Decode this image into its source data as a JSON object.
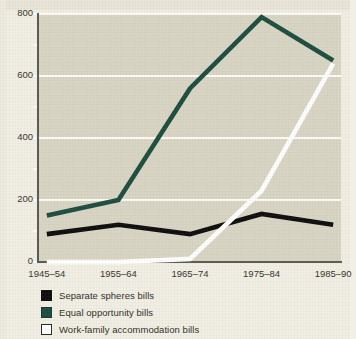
{
  "chart_data": {
    "type": "line",
    "title": "",
    "subtitle": "",
    "xlabel": "",
    "ylabel": "",
    "categories": [
      "1945–54",
      "1955–64",
      "1965–74",
      "1975–84",
      "1985–90"
    ],
    "ylim": [
      0,
      800
    ],
    "ytick_labels": [
      "0",
      "200",
      "400",
      "600",
      "800"
    ],
    "ytick_values": [
      0,
      200,
      400,
      600,
      800
    ],
    "yminor_tick_values": [
      100,
      300,
      500,
      700
    ],
    "grid": "horizontal-major-only",
    "legend_position": "below-plot-left",
    "series": [
      {
        "name": "Separate spheres bills",
        "color": "#0d0d0d",
        "values": [
          90,
          120,
          90,
          155,
          120
        ]
      },
      {
        "name": "Equal opportunity bills",
        "color": "#1d4d3f",
        "values": [
          150,
          200,
          560,
          790,
          650
        ]
      },
      {
        "name": "Work-family accommodation bills",
        "color": "#ffffff",
        "values": [
          0,
          0,
          10,
          230,
          640
        ]
      }
    ]
  },
  "axes": {
    "y_ticks": [
      {
        "label": "800",
        "value": 800,
        "major": true
      },
      {
        "label": "",
        "value": 700,
        "major": false
      },
      {
        "label": "600",
        "value": 600,
        "major": true
      },
      {
        "label": "",
        "value": 500,
        "major": false
      },
      {
        "label": "400",
        "value": 400,
        "major": true
      },
      {
        "label": "",
        "value": 300,
        "major": false
      },
      {
        "label": "200",
        "value": 200,
        "major": true
      },
      {
        "label": "",
        "value": 100,
        "major": false
      },
      {
        "label": "0",
        "value": 0,
        "major": true
      }
    ],
    "x_ticks": [
      {
        "label": "1945–54"
      },
      {
        "label": "1955–64"
      },
      {
        "label": "1965–74"
      },
      {
        "label": "1975–84"
      },
      {
        "label": "1985–90"
      }
    ]
  },
  "legend": {
    "items": [
      {
        "label": "Separate spheres bills",
        "color": "#0d0d0d",
        "border": "#0d0d0d"
      },
      {
        "label": "Equal opportunity bills",
        "color": "#1d4d3f",
        "border": "#14362c"
      },
      {
        "label": "Work-family accommodation bills",
        "color": "#ffffff",
        "border": "#2a2a24"
      }
    ]
  },
  "colors": {
    "plot_background": "#d9d5c4",
    "page_background": "#f1efe4",
    "gridline": "#fdfcf7",
    "axis": "#5c5c52",
    "text": "#35352e"
  }
}
